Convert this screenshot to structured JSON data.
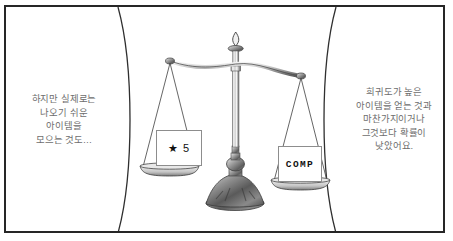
{
  "panel": {
    "name": "comic-panel",
    "background_color": "#ffffff",
    "border_color": "#262626"
  },
  "left_balloon": {
    "name": "left-narration",
    "text_color": "#6d6d6d",
    "lines": [
      "하지만 실제로는",
      "나오기 쉬운",
      "아이템을",
      "모으는 것도…"
    ]
  },
  "right_balloon": {
    "name": "right-narration",
    "text_color": "#6d6d6d",
    "lines": [
      "희귀도가 높은",
      "아이템을 얻는 것과",
      "마찬가지이거나",
      "그것보다 확률이",
      "낮았어요."
    ]
  },
  "illustration": {
    "name": "balance-scale",
    "left_pan_label": "★ 5",
    "right_pan_label": "COMP",
    "metal_light": "#f2f2f2",
    "metal_mid": "#b8b8b8",
    "metal_dark": "#4a4a4a",
    "outline": "#3a3a3a"
  }
}
